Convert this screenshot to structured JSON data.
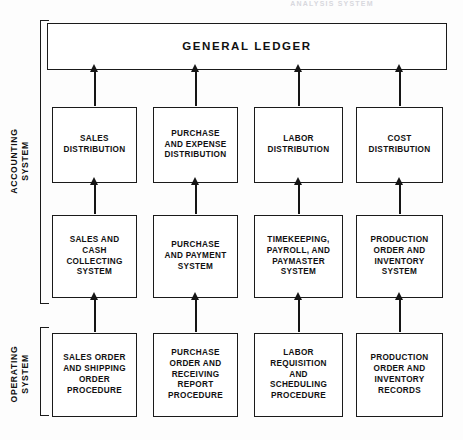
{
  "page": {
    "running_head": "ANALYSIS SYSTEM",
    "ink_color": "#151515",
    "paper_color": "#fdfdfd"
  },
  "diagram": {
    "title_box": {
      "label": "GENERAL LEDGER"
    },
    "side_labels": [
      {
        "id": "accounting",
        "line1": "ACCOUNTING",
        "line2": "SYSTEM"
      },
      {
        "id": "operating",
        "line1": "OPERATING",
        "line2": "SYSTEM"
      }
    ],
    "rows": [
      {
        "id": "distribution",
        "boxes": [
          {
            "id": "sales-distribution",
            "lines": [
              "SALES",
              "DISTRIBUTION"
            ]
          },
          {
            "id": "purchase-and-expense-distribution",
            "lines": [
              "PURCHASE",
              "AND EXPENSE",
              "DISTRIBUTION"
            ]
          },
          {
            "id": "labor-distribution",
            "lines": [
              "LABOR",
              "DISTRIBUTION"
            ]
          },
          {
            "id": "cost-distribution",
            "lines": [
              "COST",
              "DISTRIBUTION"
            ]
          }
        ]
      },
      {
        "id": "systems",
        "boxes": [
          {
            "id": "sales-and-cash-collecting-system",
            "lines": [
              "SALES AND",
              "CASH COLLECTING",
              "SYSTEM"
            ]
          },
          {
            "id": "purchase-and-payment-system",
            "lines": [
              "PURCHASE",
              "AND PAYMENT",
              "SYSTEM"
            ]
          },
          {
            "id": "timekeeping-payroll-paymaster-system",
            "lines": [
              "TIMEKEEPING,",
              "PAYROLL, AND",
              "PAYMASTER",
              "SYSTEM"
            ]
          },
          {
            "id": "production-order-and-inventory-system",
            "lines": [
              "PRODUCTION",
              "ORDER AND",
              "INVENTORY",
              "SYSTEM"
            ]
          }
        ]
      },
      {
        "id": "procedures",
        "boxes": [
          {
            "id": "sales-order-and-shipping-order-procedure",
            "lines": [
              "SALES ORDER",
              "AND SHIPPING",
              "ORDER",
              "PROCEDURE"
            ]
          },
          {
            "id": "purchase-order-and-receiving-report-procedure",
            "lines": [
              "PURCHASE",
              "ORDER AND",
              "RECEIVING REPORT",
              "PROCEDURE"
            ]
          },
          {
            "id": "labor-requisition-and-scheduling-procedure",
            "lines": [
              "LABOR REQUISITION",
              "AND",
              "SCHEDULING",
              "PROCEDURE"
            ]
          },
          {
            "id": "production-order-and-inventory-records",
            "lines": [
              "PRODUCTION",
              "ORDER AND",
              "INVENTORY",
              "RECORDS"
            ]
          }
        ]
      }
    ],
    "flow_direction": "upward"
  }
}
